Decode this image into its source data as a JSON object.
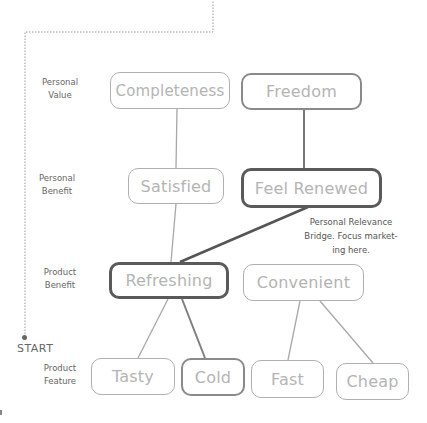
{
  "diagram": {
    "type": "means-end ladder",
    "levels": [
      {
        "id": "personal_value",
        "label_line1": "Personal",
        "label_line2": "Value"
      },
      {
        "id": "personal_benefit",
        "label_line1": "Personal",
        "label_line2": "Benefit"
      },
      {
        "id": "product_benefit",
        "label_line1": "Product",
        "label_line2": "Benefit"
      },
      {
        "id": "product_feature",
        "label_line1": "Product",
        "label_line2": "Feature"
      }
    ],
    "nodes": {
      "completeness": {
        "label": "Completeness",
        "level": "personal_value",
        "emphasis": "thin"
      },
      "freedom": {
        "label": "Freedom",
        "level": "personal_value",
        "emphasis": "mid"
      },
      "satisfied": {
        "label": "Satisfied",
        "level": "personal_benefit",
        "emphasis": "thin"
      },
      "feel_renewed": {
        "label": "Feel Renewed",
        "level": "personal_benefit",
        "emphasis": "thick"
      },
      "refreshing": {
        "label": "Refreshing",
        "level": "product_benefit",
        "emphasis": "thick"
      },
      "convenient": {
        "label": "Convenient",
        "level": "product_benefit",
        "emphasis": "thin"
      },
      "tasty": {
        "label": "Tasty",
        "level": "product_feature",
        "emphasis": "thin"
      },
      "cold": {
        "label": "Cold",
        "level": "product_feature",
        "emphasis": "mid"
      },
      "fast": {
        "label": "Fast",
        "level": "product_feature",
        "emphasis": "thin"
      },
      "cheap": {
        "label": "Cheap",
        "level": "product_feature",
        "emphasis": "thin"
      }
    },
    "edges": [
      {
        "from": "completeness",
        "to": "satisfied",
        "weight": "thin"
      },
      {
        "from": "freedom",
        "to": "feel_renewed",
        "weight": "mid"
      },
      {
        "from": "satisfied",
        "to": "refreshing",
        "weight": "thin"
      },
      {
        "from": "feel_renewed",
        "to": "refreshing",
        "weight": "thick"
      },
      {
        "from": "refreshing",
        "to": "tasty",
        "weight": "thin"
      },
      {
        "from": "refreshing",
        "to": "cold",
        "weight": "mid"
      },
      {
        "from": "convenient",
        "to": "fast",
        "weight": "thin"
      },
      {
        "from": "convenient",
        "to": "cheap",
        "weight": "thin"
      }
    ],
    "start_label": "START",
    "annotation": {
      "line1": "Personal Relevance",
      "line2": "Bridge. Focus market-",
      "line3": "ing here."
    },
    "colors": {
      "thin_border": "#b0b0b0",
      "mid_border": "#8a8a8a",
      "thick_border": "#5a5a5a",
      "node_text": "#b4b4b4",
      "label_text": "#666666"
    }
  }
}
